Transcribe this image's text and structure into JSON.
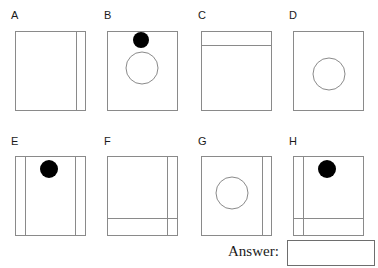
{
  "page": {
    "background": "#ffffff",
    "stroke_color": "#8a8a8a",
    "dot_color": "#000000",
    "text_color": "#1a1a1a",
    "width": 378,
    "height": 268
  },
  "panels": [
    {
      "label": "A",
      "label_x": 11,
      "label_y": 10,
      "box": {
        "x": 15,
        "y": 31,
        "w": 70,
        "h": 79
      },
      "vertical_lines": [
        76
      ],
      "horizontal_lines": [],
      "open_circles": [],
      "filled_circles": []
    },
    {
      "label": "B",
      "label_x": 104,
      "label_y": 10,
      "box": {
        "x": 107,
        "y": 31,
        "w": 70,
        "h": 79
      },
      "vertical_lines": [],
      "horizontal_lines": [],
      "open_circles": [
        {
          "cx": 142,
          "cy": 68,
          "r": 16
        }
      ],
      "filled_circles": [
        {
          "cx": 141,
          "cy": 40,
          "r": 8
        }
      ]
    },
    {
      "label": "C",
      "label_x": 198,
      "label_y": 10,
      "box": {
        "x": 201,
        "y": 31,
        "w": 70,
        "h": 79
      },
      "vertical_lines": [],
      "horizontal_lines": [
        45
      ],
      "open_circles": [],
      "filled_circles": []
    },
    {
      "label": "D",
      "label_x": 289,
      "label_y": 10,
      "box": {
        "x": 293,
        "y": 31,
        "w": 70,
        "h": 79
      },
      "vertical_lines": [],
      "horizontal_lines": [],
      "open_circles": [
        {
          "cx": 329,
          "cy": 74,
          "r": 16
        }
      ],
      "filled_circles": []
    },
    {
      "label": "E",
      "label_x": 11,
      "label_y": 136,
      "box": {
        "x": 15,
        "y": 156,
        "w": 70,
        "h": 79
      },
      "vertical_lines": [
        25,
        75
      ],
      "horizontal_lines": [],
      "open_circles": [],
      "filled_circles": [
        {
          "cx": 49,
          "cy": 169,
          "r": 9
        }
      ]
    },
    {
      "label": "F",
      "label_x": 104,
      "label_y": 136,
      "box": {
        "x": 107,
        "y": 156,
        "w": 70,
        "h": 79
      },
      "vertical_lines": [
        167
      ],
      "horizontal_lines": [
        218
      ],
      "open_circles": [],
      "filled_circles": []
    },
    {
      "label": "G",
      "label_x": 198,
      "label_y": 136,
      "box": {
        "x": 201,
        "y": 156,
        "w": 70,
        "h": 79
      },
      "vertical_lines": [
        262
      ],
      "horizontal_lines": [],
      "open_circles": [
        {
          "cx": 232,
          "cy": 193,
          "r": 16
        }
      ],
      "filled_circles": []
    },
    {
      "label": "H",
      "label_x": 289,
      "label_y": 136,
      "box": {
        "x": 293,
        "y": 156,
        "w": 70,
        "h": 79
      },
      "vertical_lines": [
        303
      ],
      "horizontal_lines": [
        218
      ],
      "open_circles": [],
      "filled_circles": [
        {
          "cx": 327,
          "cy": 169,
          "r": 9
        }
      ]
    }
  ],
  "answer": {
    "label": "Answer:",
    "label_x": 228,
    "row_y": 243,
    "value": "",
    "box": {
      "x": 287,
      "y": 240,
      "w": 88,
      "h": 26
    }
  }
}
